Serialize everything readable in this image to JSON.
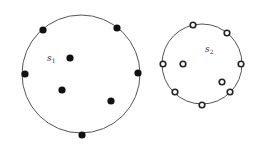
{
  "diagram": {
    "sets": [
      {
        "id": "s1",
        "label": "s",
        "subscript": "1",
        "label_pos": [
          47,
          54
        ],
        "circle": {
          "cx": 81,
          "cy": 74,
          "r": 59
        },
        "point_style": "filled",
        "points": [
          [
            43,
            30
          ],
          [
            117,
            28
          ],
          [
            70,
            58
          ],
          [
            25,
            74
          ],
          [
            138,
            73
          ],
          [
            62,
            90
          ],
          [
            111,
            101
          ],
          [
            82,
            135
          ]
        ]
      },
      {
        "id": "s2",
        "label": "s",
        "subscript": "2",
        "label_pos": [
          205,
          45
        ],
        "circle": {
          "cx": 202,
          "cy": 64,
          "r": 40
        },
        "point_style": "hollow",
        "points": [
          [
            193,
            25
          ],
          [
            227,
            33
          ],
          [
            241,
            64
          ],
          [
            163,
            64
          ],
          [
            183,
            64
          ],
          [
            222,
            82
          ],
          [
            230,
            92
          ],
          [
            175,
            92
          ],
          [
            202,
            105
          ]
        ]
      }
    ],
    "colors": {
      "boundary": "#555555",
      "filled_point": "#111111",
      "hollow_point_stroke": "#222222",
      "background": "#ffffff"
    }
  }
}
